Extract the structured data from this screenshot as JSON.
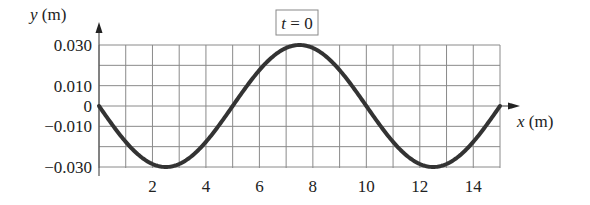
{
  "chart_data": {
    "type": "line",
    "title": "t = 0",
    "xlabel": "x (m)",
    "ylabel": "y (m)",
    "xlim": [
      0,
      15
    ],
    "ylim": [
      -0.03,
      0.03
    ],
    "grid": true,
    "x_ticks": [
      2,
      4,
      6,
      8,
      10,
      12,
      14
    ],
    "x_tick_labels": [
      "2",
      "4",
      "6",
      "8",
      "10",
      "12",
      "14"
    ],
    "y_ticks": [
      0.03,
      0.01,
      0,
      -0.01,
      -0.03
    ],
    "y_tick_labels": [
      "0.030",
      "0.010",
      "0",
      "−0.010",
      "−0.030"
    ],
    "series": [
      {
        "name": "y(x, t=0)",
        "description": "sinusoidal wave, amplitude 0.030 m, wavelength 10 m",
        "x": [
          0,
          1,
          2,
          2.5,
          3,
          4,
          5,
          6,
          7,
          7.5,
          8,
          9,
          10,
          11,
          12,
          12.5,
          13,
          14,
          15
        ],
        "values": [
          0,
          -0.0176,
          -0.0285,
          -0.03,
          -0.0285,
          -0.0176,
          0,
          0.0176,
          0.0285,
          0.03,
          0.0285,
          0.0176,
          0,
          -0.0176,
          -0.0285,
          -0.03,
          -0.0285,
          -0.0176,
          0
        ]
      }
    ]
  },
  "labels": {
    "time_box": "t = 0",
    "y_axis": "y (m)",
    "x_axis": "x (m)"
  }
}
